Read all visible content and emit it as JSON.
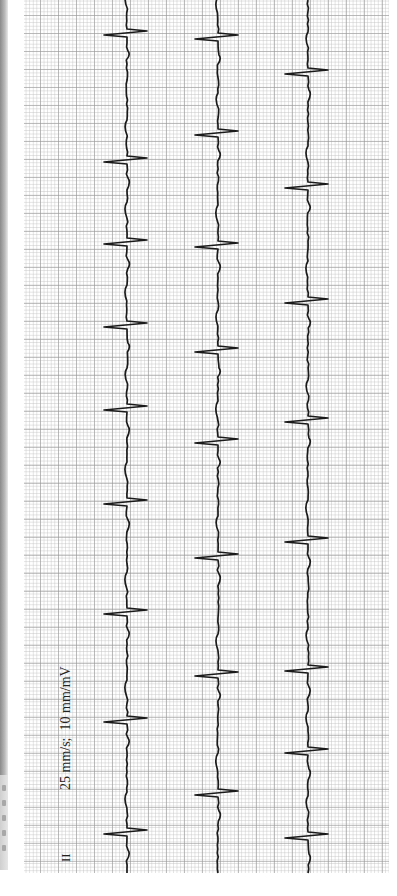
{
  "chart_data": {
    "type": "line",
    "orientation": "rotated 90° (time runs bottom to top)",
    "annotations": {
      "scale": "25 mm/s;  10 mm/mV",
      "lead": "II"
    },
    "grid": {
      "on": true,
      "minor_px": 3.6,
      "major_px": 18,
      "x_range_px": [
        24,
        389
      ],
      "y_range_px": [
        0,
        873
      ],
      "minor_color": "#d0d0d0",
      "major_color": "#a0a0a0"
    },
    "trace_color": "#1a1a1a",
    "series": [
      {
        "name": "Strip 1 (Lead II)",
        "baseline_x": 127,
        "qrs_y": [
          33,
          160,
          242,
          325,
          408,
          502,
          612,
          720,
          832
        ]
      },
      {
        "name": "Strip 2",
        "baseline_x": 218,
        "qrs_y": [
          37,
          133,
          245,
          350,
          441,
          556,
          674,
          793
        ]
      },
      {
        "name": "Strip 3",
        "baseline_x": 308,
        "qrs_y": [
          72,
          186,
          301,
          420,
          540,
          669,
          751,
          836
        ]
      }
    ],
    "qrs_shape": {
      "s_deflection_px": -23,
      "r_deflection_px": 20,
      "width_px": 6
    }
  }
}
